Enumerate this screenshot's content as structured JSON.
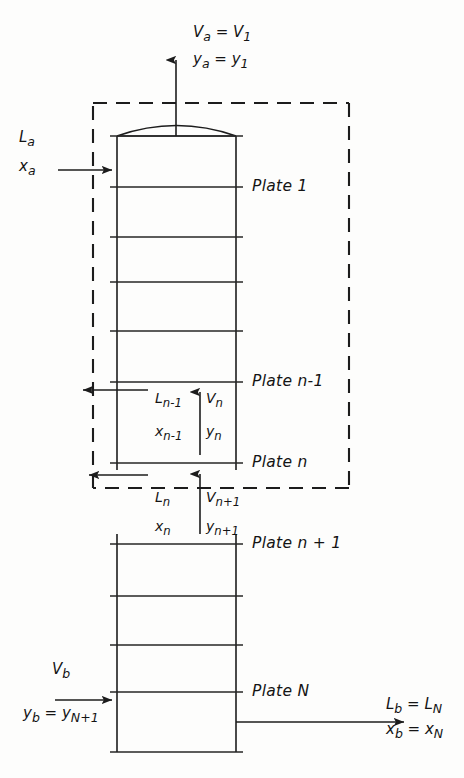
{
  "figure": {
    "type": "process-flow-diagram",
    "background_color": "#fdfdfc",
    "line_color": "#1c1c1c"
  },
  "top_stream": {
    "vapor_label": "V",
    "vapor_sub_a": "a",
    "vapor_eq": "=",
    "vapor_label2": "V",
    "vapor_sub_1": "1",
    "composition_label": "y",
    "composition_sub_a": "a",
    "composition_eq": "=",
    "composition_label2": "y",
    "composition_sub_1": "1",
    "full_vapor": "Va = V1",
    "full_composition": "ya = y1"
  },
  "feed_stream": {
    "liquid_label": "L",
    "liquid_sub": "a",
    "composition_label": "x",
    "composition_sub": "a",
    "full_liquid": "La",
    "full_composition": "xa"
  },
  "bottom_vapor_stream": {
    "label": "V",
    "sub": "b",
    "composition_label": "y",
    "composition_sub_b": "b",
    "composition_eq": "=",
    "composition_label2": "y",
    "composition_sub_n1": "N+1",
    "full_label": "Vb",
    "full_composition": "yb = yN+1"
  },
  "bottom_liquid_stream": {
    "liquid_label": "L",
    "liquid_sub_b": "b",
    "liquid_eq": "=",
    "liquid_label2": "L",
    "liquid_sub_N": "N",
    "composition_label": "x",
    "composition_sub_b": "b",
    "composition_eq": "=",
    "composition_label2": "x",
    "composition_sub_N": "N",
    "full_liquid": "Lb = LN",
    "full_composition": "xb = xN"
  },
  "interstage_upper": {
    "liquid_label": "L",
    "liquid_sub": "n-1",
    "liquid_comp_label": "x",
    "liquid_comp_sub": "n-1",
    "vapor_label": "V",
    "vapor_sub": "n",
    "vapor_comp_label": "y",
    "vapor_comp_sub": "n",
    "full_liquid": "Ln-1",
    "full_liquid_comp": "xn-1",
    "full_vapor": "Vn",
    "full_vapor_comp": "yn"
  },
  "interstage_lower": {
    "liquid_label": "L",
    "liquid_sub": "n",
    "liquid_comp_label": "x",
    "liquid_comp_sub": "n",
    "vapor_label": "V",
    "vapor_sub": "n+1",
    "vapor_comp_label": "y",
    "vapor_comp_sub": "n+1",
    "full_liquid": "Ln",
    "full_liquid_comp": "xn",
    "full_vapor": "Vn+1",
    "full_vapor_comp": "yn+1"
  },
  "plate_labels": {
    "plate_1": "Plate 1",
    "plate_n_minus_1": "Plate n-1",
    "plate_n": "Plate n",
    "plate_n_plus_1": "Plate n + 1",
    "plate_N": "Plate N"
  },
  "envelope": {
    "style": "dashed",
    "description": "control-volume boundary enclosing plates 1 through n"
  },
  "geometry": {
    "column_left_x": 117,
    "column_right_x": 236,
    "plate_tick_left_x": 110,
    "plate_tick_right_x": 243,
    "upper_plate_rows_y": [
      136,
      187,
      237,
      282,
      331,
      382,
      463
    ],
    "lower_plate_rows_y": [
      544,
      596,
      645,
      692,
      742
    ],
    "envelope_box": {
      "x1": 93,
      "y1": 103,
      "x2": 349,
      "y2": 488
    }
  }
}
